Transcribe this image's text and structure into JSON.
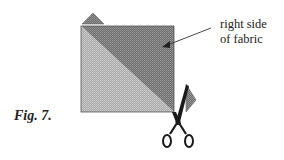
{
  "figure": {
    "label": "Fig. 7.",
    "callout_line1": "right side",
    "callout_line2": "of fabric"
  },
  "colors": {
    "dark_fabric": "#7a7a7a",
    "light_fabric": "#b8b8b8",
    "outline": "#555555",
    "ink": "#222222"
  }
}
